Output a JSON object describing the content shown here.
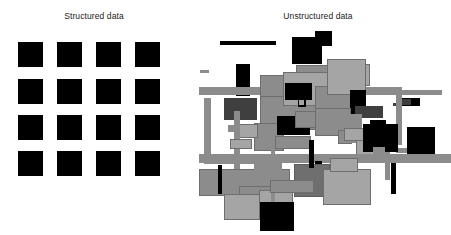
{
  "figure": {
    "background_color": "#ffffff",
    "width": 451,
    "height": 235
  },
  "panels": {
    "structured": {
      "title": "Structured data",
      "type": "regular-grid",
      "rows": 4,
      "cols": 4,
      "cell_color": "#000000",
      "cell_size": 25,
      "gap": 14,
      "origin": {
        "x": 18,
        "y": 42
      }
    },
    "unstructured": {
      "title": "Unstructured data",
      "type": "scattered-overlapping-rectangles",
      "origin": {
        "x": 195,
        "y": 28
      },
      "palette": {
        "black": "#000000",
        "dark_gray": "#3f3f3f",
        "mid_gray": "#8c8c8c",
        "light_gray": "#a5a5a5",
        "pale_gray": "#b7b7b7",
        "outline": "#6e6e6e"
      }
    }
  },
  "chart_data": {
    "type": "scatter",
    "title": "",
    "subtitle": "",
    "xlabel": "",
    "ylabel": "",
    "grid": false,
    "legend_position": "none",
    "annotations": [
      "Structured data",
      "Unstructured data"
    ],
    "panels": [
      {
        "name": "Structured data",
        "layout": "grid",
        "categories": [
          "col1",
          "col2",
          "col3",
          "col4"
        ],
        "rows": [
          "row1",
          "row2",
          "row3",
          "row4"
        ],
        "values": [
          [
            1,
            1,
            1,
            1
          ],
          [
            1,
            1,
            1,
            1
          ],
          [
            1,
            1,
            1,
            1
          ],
          [
            1,
            1,
            1,
            1
          ]
        ]
      },
      {
        "name": "Unstructured data",
        "layout": "random",
        "count": 58
      }
    ]
  },
  "grid_cells": [
    {
      "r": 0,
      "c": 0,
      "x": 0,
      "y": 0,
      "w": 25,
      "h": 25
    },
    {
      "r": 0,
      "c": 1,
      "x": 39,
      "y": 0,
      "w": 25,
      "h": 25
    },
    {
      "r": 0,
      "c": 2,
      "x": 78,
      "y": 0,
      "w": 25,
      "h": 25
    },
    {
      "r": 0,
      "c": 3,
      "x": 117,
      "y": 0,
      "w": 25,
      "h": 25
    },
    {
      "r": 1,
      "c": 0,
      "x": 0,
      "y": 37,
      "w": 25,
      "h": 25
    },
    {
      "r": 1,
      "c": 1,
      "x": 39,
      "y": 37,
      "w": 25,
      "h": 25
    },
    {
      "r": 1,
      "c": 2,
      "x": 78,
      "y": 37,
      "w": 25,
      "h": 25
    },
    {
      "r": 1,
      "c": 3,
      "x": 117,
      "y": 37,
      "w": 25,
      "h": 25
    },
    {
      "r": 2,
      "c": 0,
      "x": 0,
      "y": 73,
      "w": 25,
      "h": 25
    },
    {
      "r": 2,
      "c": 1,
      "x": 39,
      "y": 73,
      "w": 25,
      "h": 25
    },
    {
      "r": 2,
      "c": 2,
      "x": 78,
      "y": 73,
      "w": 25,
      "h": 25
    },
    {
      "r": 2,
      "c": 3,
      "x": 117,
      "y": 73,
      "w": 25,
      "h": 25
    },
    {
      "r": 3,
      "c": 0,
      "x": 0,
      "y": 109,
      "w": 25,
      "h": 25
    },
    {
      "r": 3,
      "c": 1,
      "x": 39,
      "y": 109,
      "w": 25,
      "h": 25
    },
    {
      "r": 3,
      "c": 2,
      "x": 78,
      "y": 109,
      "w": 25,
      "h": 25
    },
    {
      "r": 3,
      "c": 3,
      "x": 117,
      "y": 109,
      "w": 25,
      "h": 25
    }
  ],
  "unstructured_shapes": [
    {
      "x": 25,
      "y": 13,
      "w": 56,
      "h": 4,
      "fill": "#000000",
      "border": "none"
    },
    {
      "x": 97,
      "y": 9,
      "w": 30,
      "h": 27,
      "fill": "#000000",
      "border": "none"
    },
    {
      "x": 120,
      "y": 3,
      "w": 17,
      "h": 15,
      "fill": "#000000",
      "border": "none"
    },
    {
      "x": 41,
      "y": 36,
      "w": 14,
      "h": 32,
      "fill": "#000000",
      "border": "none"
    },
    {
      "x": 41,
      "y": 72,
      "w": 14,
      "h": 17,
      "fill": "#000000",
      "border": "none"
    },
    {
      "x": 101,
      "y": 37,
      "w": 47,
      "h": 17,
      "fill": "#8c8c8c",
      "border": "#6e6e6e"
    },
    {
      "x": 141,
      "y": 36,
      "w": 34,
      "h": 22,
      "fill": "#a5a5a5",
      "border": "#6e6e6e"
    },
    {
      "x": 4,
      "y": 59,
      "w": 199,
      "h": 6,
      "fill": "#8c8c8c",
      "border": "none"
    },
    {
      "x": 4,
      "y": 62,
      "w": 243,
      "h": 5,
      "fill": "#8c8c8c",
      "border": "none"
    },
    {
      "x": 9,
      "y": 70,
      "w": 7,
      "h": 64,
      "fill": "#8c8c8c",
      "border": "none"
    },
    {
      "x": 9,
      "y": 131,
      "w": 64,
      "h": 5,
      "fill": "#8c8c8c",
      "border": "none"
    },
    {
      "x": 29,
      "y": 70,
      "w": 33,
      "h": 22,
      "fill": "#3f3f3f",
      "border": "none"
    },
    {
      "x": 5,
      "y": 42,
      "w": 9,
      "h": 3,
      "fill": "#8c8c8c",
      "border": "none"
    },
    {
      "x": 65,
      "y": 64,
      "w": 68,
      "h": 38,
      "fill": "#8c8c8c",
      "border": "#6e6e6e"
    },
    {
      "x": 65,
      "y": 47,
      "w": 55,
      "h": 22,
      "fill": "#8c8c8c",
      "border": "#6e6e6e"
    },
    {
      "x": 88,
      "y": 44,
      "w": 56,
      "h": 34,
      "fill": "#a5a5a5",
      "border": "#6e6e6e"
    },
    {
      "x": 120,
      "y": 58,
      "w": 44,
      "h": 40,
      "fill": "#8c8c8c",
      "border": "#6e6e6e"
    },
    {
      "x": 132,
      "y": 31,
      "w": 39,
      "h": 36,
      "fill": "#a5a5a5",
      "border": "#6e6e6e"
    },
    {
      "x": 90,
      "y": 55,
      "w": 27,
      "h": 17,
      "fill": "#000000",
      "border": "none"
    },
    {
      "x": 155,
      "y": 62,
      "w": 16,
      "h": 24,
      "fill": "#000000",
      "border": "none"
    },
    {
      "x": 160,
      "y": 78,
      "w": 28,
      "h": 12,
      "fill": "#3f3f3f",
      "border": "none"
    },
    {
      "x": 103,
      "y": 71,
      "w": 8,
      "h": 8,
      "fill": "#000000",
      "border": "none"
    },
    {
      "x": 104,
      "y": 72,
      "w": 5,
      "h": 5,
      "fill": "#a5a5a5",
      "border": "none"
    },
    {
      "x": 198,
      "y": 75,
      "w": 9,
      "h": 3,
      "fill": "#3f3f3f",
      "border": "none"
    },
    {
      "x": 201,
      "y": 59,
      "w": 6,
      "h": 58,
      "fill": "#8c8c8c",
      "border": "none"
    },
    {
      "x": 207,
      "y": 70,
      "w": 18,
      "h": 8,
      "fill": "#000000",
      "border": "none"
    },
    {
      "x": 207,
      "y": 71,
      "w": 9,
      "h": 6,
      "fill": "#3f3f3f",
      "border": "none"
    },
    {
      "x": 33,
      "y": 97,
      "w": 13,
      "h": 7,
      "fill": "#8c8c8c",
      "border": "none"
    },
    {
      "x": 59,
      "y": 95,
      "w": 30,
      "h": 28,
      "fill": "#8c8c8c",
      "border": "#6e6e6e"
    },
    {
      "x": 82,
      "y": 88,
      "w": 33,
      "h": 19,
      "fill": "#000000",
      "border": "none"
    },
    {
      "x": 100,
      "y": 83,
      "w": 30,
      "h": 17,
      "fill": "#8c8c8c",
      "border": "#6e6e6e"
    },
    {
      "x": 80,
      "y": 108,
      "w": 36,
      "h": 13,
      "fill": "#8c8c8c",
      "border": "#6e6e6e"
    },
    {
      "x": 124,
      "y": 87,
      "w": 35,
      "h": 20,
      "fill": "#000000",
      "border": "none"
    },
    {
      "x": 120,
      "y": 80,
      "w": 36,
      "h": 28,
      "fill": "#8c8c8c",
      "border": "#6e6e6e"
    },
    {
      "x": 143,
      "y": 102,
      "w": 14,
      "h": 14,
      "fill": "#8c8c8c",
      "border": "#6e6e6e"
    },
    {
      "x": 155,
      "y": 86,
      "w": 12,
      "h": 29,
      "fill": "#8c8c8c",
      "border": "none"
    },
    {
      "x": 160,
      "y": 100,
      "w": 37,
      "h": 10,
      "fill": "#8c8c8c",
      "border": "none"
    },
    {
      "x": 161,
      "y": 112,
      "w": 34,
      "h": 20,
      "fill": "#a5a5a5",
      "border": "#6e6e6e"
    },
    {
      "x": 43,
      "y": 96,
      "w": 20,
      "h": 14,
      "fill": "#a5a5a5",
      "border": "#6e6e6e"
    },
    {
      "x": 39,
      "y": 83,
      "w": 6,
      "h": 76,
      "fill": "#8c8c8c",
      "border": "none"
    },
    {
      "x": 4,
      "y": 126,
      "w": 252,
      "h": 9,
      "fill": "#8c8c8c",
      "border": "none"
    },
    {
      "x": 190,
      "y": 104,
      "w": 5,
      "h": 48,
      "fill": "#8c8c8c",
      "border": "none"
    },
    {
      "x": 201,
      "y": 120,
      "w": 38,
      "h": 5,
      "fill": "#8c8c8c",
      "border": "none"
    },
    {
      "x": 190,
      "y": 127,
      "w": 66,
      "h": 7,
      "fill": "#8c8c8c",
      "border": "none"
    },
    {
      "x": 35,
      "y": 111,
      "w": 22,
      "h": 10,
      "fill": "#a5a5a5",
      "border": "#6e6e6e"
    },
    {
      "x": 4,
      "y": 141,
      "w": 91,
      "h": 27,
      "fill": "#8c8c8c",
      "border": "#6e6e6e"
    },
    {
      "x": 44,
      "y": 158,
      "w": 48,
      "h": 27,
      "fill": "#8c8c8c",
      "border": "#6e6e6e"
    },
    {
      "x": 29,
      "y": 166,
      "w": 44,
      "h": 26,
      "fill": "#a5a5a5",
      "border": "#6e6e6e"
    },
    {
      "x": 64,
      "y": 162,
      "w": 34,
      "h": 29,
      "fill": "#a5a5a5",
      "border": "#6e6e6e"
    },
    {
      "x": 76,
      "y": 108,
      "w": 4,
      "h": 82,
      "fill": "#8c8c8c",
      "border": "none"
    },
    {
      "x": 120,
      "y": 133,
      "w": 7,
      "h": 23,
      "fill": "#000000",
      "border": "none"
    },
    {
      "x": 59,
      "y": 135,
      "w": 28,
      "h": 12,
      "fill": "#8c8c8c",
      "border": "none"
    },
    {
      "x": 99,
      "y": 136,
      "w": 36,
      "h": 33,
      "fill": "#6f6f6f",
      "border": "#5c5c5c"
    },
    {
      "x": 128,
      "y": 141,
      "w": 48,
      "h": 36,
      "fill": "#a5a5a5",
      "border": "#6e6e6e"
    },
    {
      "x": 75,
      "y": 152,
      "w": 44,
      "h": 13,
      "fill": "#8c8c8c",
      "border": "#6e6e6e"
    },
    {
      "x": 65,
      "y": 174,
      "w": 34,
      "h": 29,
      "fill": "#000000",
      "border": "none"
    },
    {
      "x": 135,
      "y": 130,
      "w": 28,
      "h": 14,
      "fill": "#a5a5a5",
      "border": "#6e6e6e"
    },
    {
      "x": 149,
      "y": 100,
      "w": 26,
      "h": 13,
      "fill": "#a5a5a5",
      "border": "#6e6e6e"
    },
    {
      "x": 175,
      "y": 92,
      "w": 16,
      "h": 10,
      "fill": "#000000",
      "border": "none"
    },
    {
      "x": 168,
      "y": 96,
      "w": 35,
      "h": 28,
      "fill": "#000000",
      "border": "none"
    },
    {
      "x": 212,
      "y": 99,
      "w": 28,
      "h": 27,
      "fill": "#000000",
      "border": "none"
    },
    {
      "x": 196,
      "y": 135,
      "w": 5,
      "h": 31,
      "fill": "#000000",
      "border": "none"
    },
    {
      "x": 114,
      "y": 112,
      "w": 5,
      "h": 28,
      "fill": "#000000",
      "border": "none"
    },
    {
      "x": 23,
      "y": 137,
      "w": 4,
      "h": 29,
      "fill": "#000000",
      "border": "none"
    },
    {
      "x": 178,
      "y": 119,
      "w": 12,
      "h": 8,
      "fill": "#8c8c8c",
      "border": "none"
    }
  ]
}
